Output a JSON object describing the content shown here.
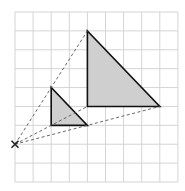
{
  "diagram": {
    "grid": {
      "cols": 9,
      "rows": 9,
      "origin_px": [
        15,
        12
      ],
      "cell_w": 18.1,
      "cell_h": 18.89,
      "line_color": "#d4d4d4"
    },
    "centre": {
      "grid": [
        0,
        7
      ],
      "marker": "x-cross",
      "color": "#222222"
    },
    "object_triangle": {
      "vertices_grid": [
        [
          2,
          4
        ],
        [
          2,
          6
        ],
        [
          4,
          6
        ]
      ],
      "fill": "#cfcfcf",
      "stroke": "#111111"
    },
    "image_triangle": {
      "vertices_grid": [
        [
          4,
          1
        ],
        [
          4,
          5
        ],
        [
          8,
          5
        ]
      ],
      "fill": "#cfcfcf",
      "stroke": "#111111"
    },
    "scale_factor": 2,
    "construction_lines": {
      "style": "dashed",
      "color": "#555555",
      "targets_grid": [
        [
          4,
          1
        ],
        [
          4,
          5
        ],
        [
          8,
          5
        ]
      ]
    }
  }
}
